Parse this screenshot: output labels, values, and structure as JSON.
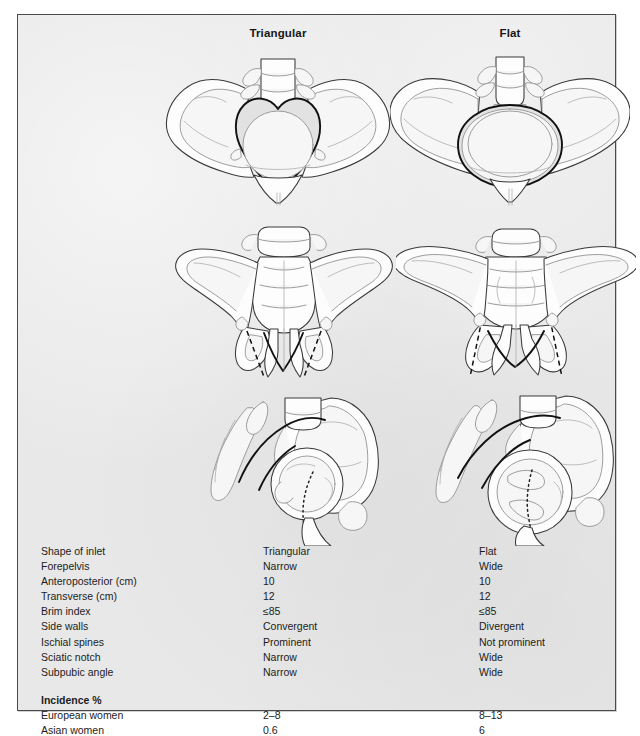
{
  "figure": {
    "background_color": "#e8e8e8",
    "border_color": "#4a4a4a",
    "page_color": "#ffffff"
  },
  "headings": {
    "triangular": "Triangular",
    "flat": "Flat"
  },
  "illustrations": {
    "rows": [
      {
        "view": "pelvic-inlet-superior-view",
        "triangular": {
          "caption_implied": "Triangular",
          "brim_shape": "heart-shaped / triangular",
          "alt": "Pelvis viewed from above showing a triangular heart-shaped pelvic brim with narrow forepelvis"
        },
        "flat": {
          "caption_implied": "Flat",
          "brim_shape": "wide transverse oval",
          "alt": "Pelvis viewed from above showing a wide flattened oval pelvic brim with wide forepelvis"
        }
      },
      {
        "view": "pelvis-anterior-view",
        "triangular": {
          "side_walls": "Convergent",
          "subpubic_angle": "Narrow",
          "alt": "Anterior view of pelvis with dashed lines showing convergent side walls and a narrow subpubic arch"
        },
        "flat": {
          "side_walls": "Divergent",
          "subpubic_angle": "Wide",
          "alt": "Anterior view of pelvis with dashed lines showing divergent side walls and a wide subpubic arch"
        }
      },
      {
        "view": "pelvis-lateral-oblique-view",
        "triangular": {
          "sciatic_notch": "Narrow",
          "alt": "Lateral oblique view of pelvis with dotted axis showing a narrow sciatic notch"
        },
        "flat": {
          "sciatic_notch": "Wide",
          "alt": "Lateral oblique view of pelvis with dotted axis showing a wide sciatic notch"
        }
      }
    ]
  },
  "table": {
    "rows": [
      {
        "label": "Shape of inlet",
        "triangular": "Triangular",
        "flat": "Flat"
      },
      {
        "label": "Forepelvis",
        "triangular": "Narrow",
        "flat": "Wide"
      },
      {
        "label": "Anteroposterior (cm)",
        "triangular": "10",
        "flat": "10"
      },
      {
        "label": "Transverse (cm)",
        "triangular": "12",
        "flat": "12"
      },
      {
        "label": "Brim index",
        "triangular": "≤85",
        "flat": "≤85"
      },
      {
        "label": "Side walls",
        "triangular": "Convergent",
        "flat": "Divergent"
      },
      {
        "label": "Ischial spines",
        "triangular": "Prominent",
        "flat": "Not prominent"
      },
      {
        "label": "Sciatic notch",
        "triangular": "Narrow",
        "flat": "Wide"
      },
      {
        "label": "Subpubic angle",
        "triangular": "Narrow",
        "flat": "Wide"
      }
    ],
    "incidence_heading": "Incidence %",
    "incidence_rows": [
      {
        "label": "European women",
        "triangular": "2–8",
        "flat": "8–13"
      },
      {
        "label": "Asian women",
        "triangular": "0.6",
        "flat": "6"
      }
    ]
  }
}
